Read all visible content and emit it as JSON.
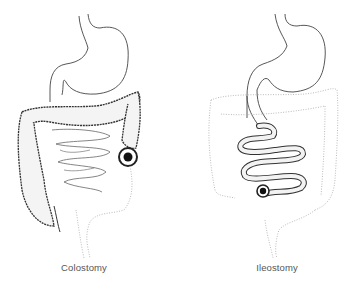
{
  "diagram": {
    "panels": [
      {
        "id": "colostomy",
        "label": "Colostomy",
        "structures": [
          "esophagus",
          "stomach",
          "large-intestine (highlighted)",
          "small-intestine",
          "rectum (dotted, inactive)",
          "stoma"
        ]
      },
      {
        "id": "ileostomy",
        "label": "Ileostomy",
        "structures": [
          "esophagus",
          "stomach",
          "small-intestine (highlighted)",
          "large-intestine (dotted, inactive)",
          "rectum (dotted, inactive)",
          "stoma"
        ]
      }
    ],
    "colors": {
      "outline": "#333333",
      "dotted": "#aaaaaa",
      "stoma": "#111111",
      "label": "#555555"
    }
  }
}
